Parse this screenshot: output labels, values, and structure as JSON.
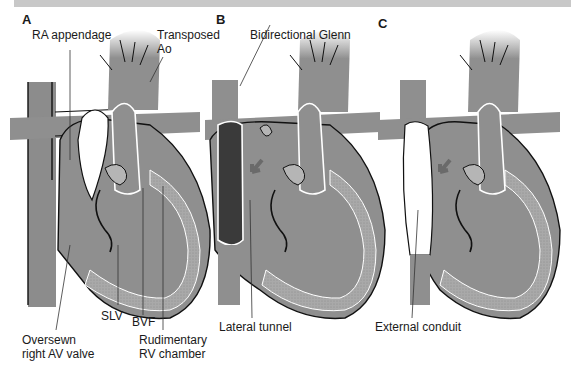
{
  "figure": {
    "panels": [
      {
        "letter": "A",
        "labels": {
          "ra_appendage": "RA appendage",
          "transposed_ao_1": "Transposed",
          "transposed_ao_2": "Ao",
          "slv": "SLV",
          "bvf": "BVF",
          "oversewn_1": "Oversewn",
          "oversewn_2": "right AV valve",
          "rudimentary_1": "Rudimentary",
          "rudimentary_2": "RV chamber"
        }
      },
      {
        "letter": "B",
        "labels": {
          "bidirectional_glenn": "Bidirectional Glenn",
          "lateral_tunnel": "Lateral tunnel"
        }
      },
      {
        "letter": "C",
        "labels": {
          "external_conduit": "External conduit"
        }
      }
    ]
  },
  "colors": {
    "tissue": "#8f8f8f",
    "tissue_dark": "#7a7a7a",
    "myocardium": "#a8a8a8",
    "tunnel": "#3a3a3a",
    "conduit": "#ffffff",
    "outline": "#111111",
    "topbar": "#c8c8c8"
  }
}
